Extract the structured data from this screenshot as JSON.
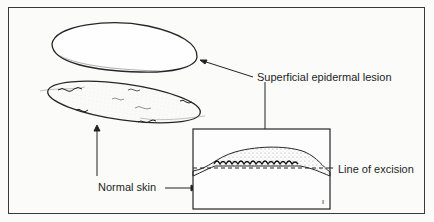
{
  "figure": {
    "caption_partial": "Fig. — Superficial epidermal lesion",
    "labels": {
      "lesion": "Superficial epidermal lesion",
      "normal_skin": "Normal skin",
      "excision": "Line of excision"
    },
    "colors": {
      "ink": "#222222",
      "paper": "#fbfbfa",
      "stipple": "#9a9a9a"
    }
  }
}
